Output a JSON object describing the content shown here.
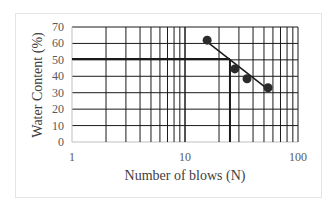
{
  "chart_data": {
    "type": "scatter",
    "title": "",
    "xlabel": "Number of blows (N)",
    "ylabel": "Water Content (%)",
    "xscale": "log",
    "xlim": [
      1,
      100
    ],
    "ylim": [
      0,
      70
    ],
    "x_ticks": [
      "1",
      "10",
      "100"
    ],
    "y_ticks": [
      "0",
      "10",
      "20",
      "30",
      "40",
      "50",
      "60",
      "70"
    ],
    "grid": true,
    "legend": null,
    "series": [
      {
        "name": "Test points",
        "x": [
          15.7,
          27.6,
          35.4,
          54.3
        ],
        "y": [
          62,
          44.5,
          38.5,
          33
        ],
        "marker": "circle"
      }
    ],
    "trendline": {
      "x": [
        15.7,
        54.3
      ],
      "y": [
        61,
        32
      ]
    },
    "annotations": [
      {
        "type": "horizontal-line",
        "y": 50.5,
        "x_from": 1,
        "x_to": 25
      },
      {
        "type": "vertical-line",
        "x": 25,
        "y_from": 0,
        "y_to": 50.5
      }
    ]
  },
  "labels": {
    "xlabel": "Number of blows (N)",
    "ylabel": "Water Content (%)",
    "x_ticks": [
      "1",
      "10",
      "100"
    ],
    "y_ticks": [
      "0",
      "10",
      "20",
      "30",
      "40",
      "50",
      "60",
      "70"
    ]
  },
  "colors": {
    "grid": "#1a1a1a",
    "marker": "#2b2b2b",
    "line": "#1a1a1a",
    "text": "#595959"
  }
}
